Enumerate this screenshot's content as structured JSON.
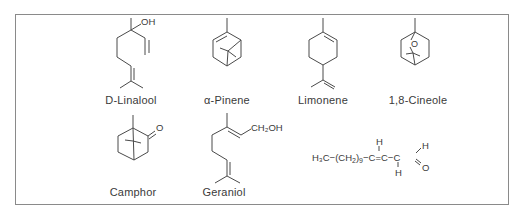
{
  "figure": {
    "compounds": [
      {
        "id": "linalool",
        "label": "D-Linalool",
        "atoms": [
          "OH"
        ]
      },
      {
        "id": "pinene",
        "label": "α-Pinene",
        "atoms": []
      },
      {
        "id": "limonene",
        "label": "Limonene",
        "atoms": []
      },
      {
        "id": "cineole",
        "label": "1,8-Cineole",
        "atoms": [
          "O"
        ]
      },
      {
        "id": "camphor",
        "label": "Camphor",
        "atoms": [
          "O"
        ]
      },
      {
        "id": "geraniol",
        "label": "Geraniol",
        "atoms": [
          "CH₂OH"
        ]
      },
      {
        "id": "aldehyde",
        "label": "",
        "formula": {
          "h3c": "H₃C−(CH",
          "sub2": "2",
          "close": ")",
          "sub9": "9",
          "chain": "−C=C−C",
          "h_top": "H",
          "h_bottom": "H",
          "h_ald": "H",
          "o_ald": "O"
        }
      }
    ]
  },
  "colors": {
    "ink": "#3a3a3a",
    "frame": "#8a8a8a",
    "background": "#ffffff"
  }
}
